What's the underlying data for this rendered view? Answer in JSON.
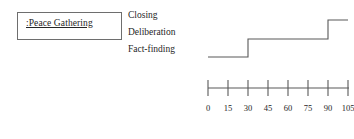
{
  "object_box": {
    "label": ":Peace Gathering"
  },
  "phases": [
    {
      "label": "Closing"
    },
    {
      "label": "Deliberation"
    },
    {
      "label": "Fact-finding"
    }
  ],
  "colors": {
    "stroke": "#585858",
    "box_border": "#6e6e6e",
    "text": "#262626",
    "background": "#ffffff"
  },
  "chart_data": {
    "type": "line",
    "title": "",
    "xlabel": "",
    "ylabel": "",
    "subtitle": "",
    "grid": false,
    "legend": "none",
    "step_style": "post",
    "xlim": [
      0,
      112
    ],
    "xticks": [
      0,
      15,
      30,
      45,
      60,
      75,
      90,
      105
    ],
    "xtick_labels": [
      "0",
      "15",
      "30",
      "45",
      "60",
      "75",
      "90",
      "105"
    ],
    "ylim": [
      0,
      3
    ],
    "ycategories": [
      "Fact-finding",
      "Deliberation",
      "Closing"
    ],
    "series": [
      {
        "name": "Peace Gathering phase",
        "points": [
          {
            "x": 0,
            "y": 1,
            "state": "Fact-finding"
          },
          {
            "x": 30,
            "y": 1,
            "state": "Fact-finding"
          },
          {
            "x": 30,
            "y": 2,
            "state": "Deliberation"
          },
          {
            "x": 90,
            "y": 2,
            "state": "Deliberation"
          },
          {
            "x": 90,
            "y": 3,
            "state": "Closing"
          },
          {
            "x": 105,
            "y": 3,
            "state": "Closing"
          }
        ]
      }
    ],
    "segments": [
      {
        "state": "Fact-finding",
        "start": 0,
        "end": 30
      },
      {
        "state": "Deliberation",
        "start": 30,
        "end": 90
      },
      {
        "state": "Closing",
        "start": 90,
        "end": 105
      }
    ]
  }
}
